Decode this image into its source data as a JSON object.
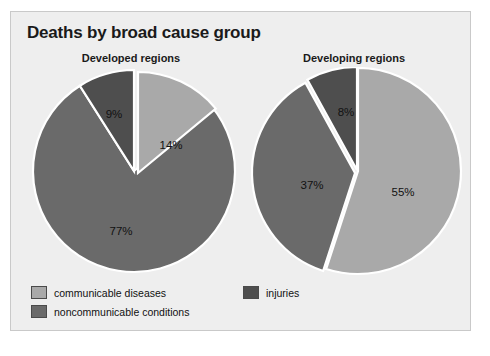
{
  "panel": {
    "background": "#eeeeee",
    "border_color": "#c9c9c9"
  },
  "title": "Deaths by broad cause group",
  "colors": {
    "communicable": "#a9a9a9",
    "noncommunicable": "#6a6a6a",
    "injuries": "#4e4e4e",
    "divider": "#ffffff",
    "text": "#111111"
  },
  "legend": {
    "items": [
      {
        "label": "communicable diseases",
        "color": "#a9a9a9",
        "key": "communicable"
      },
      {
        "label": "noncommunicable conditions",
        "color": "#6a6a6a",
        "key": "noncommunicable"
      },
      {
        "label": "injuries",
        "color": "#4e4e4e",
        "key": "injuries"
      }
    ]
  },
  "charts": [
    {
      "title": "Developed regions",
      "labels": [
        "14%",
        "77%",
        "9%"
      ]
    },
    {
      "title": "Developing regions",
      "labels": [
        "55%",
        "37%",
        "8%"
      ]
    }
  ],
  "chart_data": [
    {
      "type": "pie",
      "title": "Developed regions",
      "categories": [
        "communicable diseases",
        "noncommunicable conditions",
        "injuries"
      ],
      "values": [
        14,
        77,
        9
      ],
      "value_labels": [
        "14%",
        "77%",
        "9%"
      ],
      "units": "percent",
      "start_angle_deg": 0,
      "direction": "clockwise",
      "colors": [
        "#a9a9a9",
        "#6a6a6a",
        "#4e4e4e"
      ],
      "legend": "bottom",
      "grid": false
    },
    {
      "type": "pie",
      "title": "Developing regions",
      "categories": [
        "communicable diseases",
        "noncommunicable conditions",
        "injuries"
      ],
      "values": [
        55,
        37,
        8
      ],
      "value_labels": [
        "55%",
        "37%",
        "8%"
      ],
      "units": "percent",
      "start_angle_deg": 0,
      "direction": "clockwise",
      "colors": [
        "#a9a9a9",
        "#6a6a6a",
        "#4e4e4e"
      ],
      "legend": "bottom",
      "grid": false
    }
  ],
  "figure": {
    "suptitle": "Deaths by broad cause group",
    "legend_position": "bottom-left",
    "n_panels": 2
  }
}
